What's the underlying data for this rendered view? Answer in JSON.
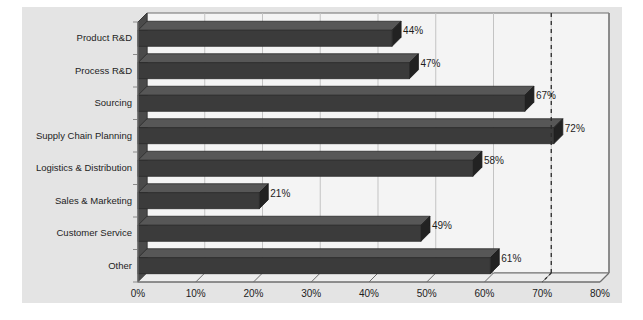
{
  "chart_data": {
    "type": "bar",
    "orientation": "horizontal",
    "title": "",
    "subtitle": "",
    "xlabel": "",
    "ylabel": "",
    "categories": [
      "Product R&D",
      "Process R&D",
      "Sourcing",
      "Supply Chain Planning",
      "Logistics & Distribution",
      "Sales & Marketing",
      "Customer Service",
      "Other"
    ],
    "values": [
      44,
      47,
      67,
      72,
      58,
      21,
      49,
      61
    ],
    "data_labels": [
      "44%",
      "47%",
      "67%",
      "72%",
      "58%",
      "21%",
      "49%",
      "61%"
    ],
    "xlim": [
      0,
      80
    ],
    "xticks": [
      0,
      10,
      20,
      30,
      40,
      50,
      60,
      70,
      80
    ],
    "xtick_labels": [
      "0%",
      "10%",
      "20%",
      "30%",
      "40%",
      "50%",
      "60%",
      "70%",
      "80%"
    ],
    "grid": true,
    "grid_axis": "x",
    "legend": null,
    "annotations": [
      {
        "type": "reference-line",
        "style": "dashed",
        "orientation": "vertical",
        "value": 70,
        "label": ""
      }
    ],
    "style": {
      "bar_color": "#3b3b3b",
      "bar_top_color": "#575757",
      "bar_side_color": "#222222",
      "plot_background": "#f4f4f4",
      "canvas_background": "#e4e4e4",
      "grid_color": "#c3c3c3",
      "axis_color": "#6e6e6e",
      "text_color": "#1d1d1d",
      "effect": "3d"
    }
  }
}
